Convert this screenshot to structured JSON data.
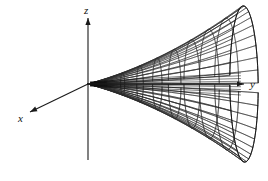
{
  "figure": {
    "kind": "3d-surface-plot",
    "background_color": "#ffffff",
    "line_color": "#2b2b2b",
    "axis_color": "#1a1a1a",
    "label_color": "#111111",
    "width": 268,
    "height": 181
  },
  "axes": {
    "origin": {
      "x": 88,
      "y": 84
    },
    "items": [
      {
        "id": "x",
        "label": "x",
        "label_x": 18,
        "label_y": 122,
        "tip_x": 30,
        "tip_y": 112,
        "tail_x": 88,
        "tail_y": 84,
        "arrow": true
      },
      {
        "id": "y",
        "label": "y",
        "label_x": 250,
        "label_y": 88,
        "tip_x": 244,
        "tip_y": 84,
        "tail_x": 88,
        "tail_y": 84,
        "arrow": true
      },
      {
        "id": "z",
        "label": "z",
        "label_x": 84,
        "label_y": 14,
        "tip_x": 88,
        "tip_y": 18,
        "tail_x": 88,
        "tail_y": 160,
        "arrow": true
      }
    ]
  },
  "chart_data": {
    "type": "surface",
    "title": "",
    "xlabel": "x",
    "ylabel": "y",
    "zlabel": "z",
    "surface_equation": "x^2 + z^2 = c^2 * y^2",
    "surface_name": "elliptic double cone",
    "axis_of_symmetry": "y",
    "nappes": 2,
    "grid": {
      "radial_lines": 18,
      "circumferential_lines": 9,
      "upper_nappe_rings": 9,
      "lower_nappe_rings": 9
    },
    "projection": {
      "apex_screen": [
        88,
        84
      ],
      "y_scale_px": 156,
      "cone_half_width_px": 86,
      "cone_half_height_px": 78,
      "tilt": "slight downward view onto upper nappe"
    },
    "legend": [],
    "annotations": []
  }
}
